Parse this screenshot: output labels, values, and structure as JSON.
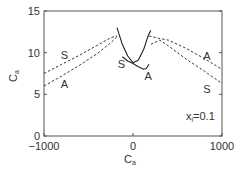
{
  "chart_data": {
    "type": "line",
    "title": "",
    "xlabel": "C",
    "xlabel_sub": "a",
    "ylabel": "C",
    "ylabel_sub": "a",
    "xlim": [
      -1000,
      1000
    ],
    "ylim": [
      0,
      15
    ],
    "xticks": [
      -1000,
      0,
      1000
    ],
    "yticks": [
      0,
      5,
      10,
      15
    ],
    "grid": false,
    "annotation": {
      "text": "x",
      "sub": "i",
      "rest": "=0.1"
    },
    "series": [
      {
        "name": "S (left, dashed)",
        "style": "dashed",
        "label": "S",
        "x": [
          -1000,
          -800,
          -600,
          -400,
          -250,
          -180
        ],
        "y": [
          7.5,
          8.6,
          9.7,
          10.9,
          11.8,
          12.0
        ]
      },
      {
        "name": "A (left, dashed)",
        "style": "dashed",
        "label": "A",
        "x": [
          -1000,
          -800,
          -600,
          -400,
          -250,
          -180
        ],
        "y": [
          6.0,
          7.2,
          8.5,
          9.9,
          11.2,
          11.9
        ]
      },
      {
        "name": "A (right, dashed)",
        "style": "dashed",
        "label": "A",
        "x": [
          180,
          300,
          400,
          600,
          800,
          1000
        ],
        "y": [
          12.0,
          11.7,
          11.5,
          10.5,
          9.3,
          8.0
        ]
      },
      {
        "name": "S (right, dashed)",
        "style": "dashed",
        "label": "S",
        "x": [
          200,
          300,
          400,
          600,
          800,
          1000
        ],
        "y": [
          11.0,
          11.5,
          10.8,
          9.2,
          7.8,
          6.3
        ]
      },
      {
        "name": "parabola (solid)",
        "style": "solid",
        "label": "",
        "x": [
          -180,
          -120,
          -60,
          0,
          60,
          120,
          170,
          200
        ],
        "y": [
          13.0,
          11.0,
          9.6,
          8.8,
          9.1,
          10.4,
          12.0,
          12.7
        ]
      },
      {
        "name": "S-A (solid)",
        "style": "solid",
        "label": "S/A",
        "x": [
          -120,
          -60,
          0,
          60,
          120,
          150,
          180
        ],
        "y": [
          9.5,
          9.0,
          8.7,
          8.3,
          8.0,
          8.1,
          8.6
        ]
      }
    ],
    "curve_labels": [
      {
        "text": "S",
        "x": -770,
        "y": 9.7
      },
      {
        "text": "A",
        "x": -770,
        "y": 6.3
      },
      {
        "text": "S",
        "x": -130,
        "y": 8.7
      },
      {
        "text": "A",
        "x": 170,
        "y": 7.2
      },
      {
        "text": "A",
        "x": 830,
        "y": 9.6
      },
      {
        "text": "S",
        "x": 830,
        "y": 5.7
      }
    ]
  }
}
